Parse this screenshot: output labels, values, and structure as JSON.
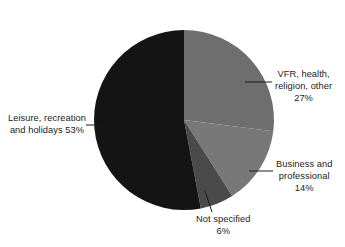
{
  "chart_data": {
    "type": "pie",
    "title": "",
    "subtitle": "",
    "xlabel": "",
    "ylabel": "",
    "legend_position": "none",
    "grid": false,
    "labels_style": "callout-leader-lines",
    "start_angle_deg": 0,
    "direction": "clockwise",
    "categories": [
      "VFR, health, religion, other",
      "Business and professional",
      "Not specified",
      "Leisure, recreation and holidays"
    ],
    "values": [
      27,
      14,
      6,
      53
    ],
    "value_unit": "%",
    "colors": [
      "#6e6e6e",
      "#787878",
      "#4a4a4a",
      "#141414"
    ],
    "slices": [
      {
        "name": "VFR, health, religion, other",
        "value": 27,
        "value_text": "27%",
        "color": "#6e6e6e",
        "label_lines": [
          "VFR, health,",
          "religion, other",
          "27%"
        ]
      },
      {
        "name": "Business and professional",
        "value": 14,
        "value_text": "14%",
        "color": "#787878",
        "label_lines": [
          "Business and",
          "professional",
          "14%"
        ]
      },
      {
        "name": "Not specified",
        "value": 6,
        "value_text": "6%",
        "color": "#4a4a4a",
        "label_lines": [
          "Not specified",
          "6%"
        ]
      },
      {
        "name": "Leisure, recreation and holidays",
        "value": 53,
        "value_text": "53%",
        "color": "#141414",
        "label_lines": [
          "Leisure, recreation",
          "and holidays 53%"
        ]
      }
    ]
  }
}
